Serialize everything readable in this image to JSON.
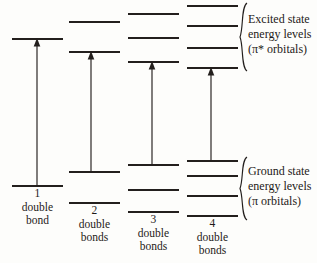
{
  "figure": {
    "background_color": "#fdfdfb",
    "ink_color": "#231f1d"
  },
  "columns": [
    {
      "id": "col-1",
      "number": "1",
      "word_line_1": "double",
      "word_line_2": "bond",
      "x_left": 12,
      "x_right": 63,
      "arrow_x": 37,
      "ground_levels": [
        186
      ],
      "excited_levels": [
        39
      ],
      "transition": {
        "from_y": 186,
        "to_y": 39
      }
    },
    {
      "id": "col-2",
      "number": "2",
      "word_line_1": "double",
      "word_line_2": "bonds",
      "x_left": 69,
      "x_right": 120,
      "arrow_x": 91,
      "ground_levels": [
        172,
        203
      ],
      "excited_levels": [
        22,
        52
      ],
      "transition": {
        "from_y": 172,
        "to_y": 52
      }
    },
    {
      "id": "col-3",
      "number": "3",
      "word_line_1": "double",
      "word_line_2": "bonds",
      "x_left": 128,
      "x_right": 179,
      "arrow_x": 152,
      "ground_levels": [
        165,
        190,
        212
      ],
      "excited_levels": [
        14,
        38,
        62
      ],
      "transition": {
        "from_y": 165,
        "to_y": 62
      }
    },
    {
      "id": "col-4",
      "number": "4",
      "word_line_1": "double",
      "word_line_2": "bonds",
      "x_left": 187,
      "x_right": 238,
      "arrow_x": 211,
      "ground_levels": [
        161,
        176,
        196,
        216
      ],
      "excited_levels": [
        6,
        26,
        48,
        68
      ],
      "transition": {
        "from_y": 161,
        "to_y": 68
      }
    }
  ],
  "annotations": {
    "excited": {
      "line_1": "Excited state",
      "line_2": "energy levels",
      "line_3": "(π* orbitals)",
      "brace_top_y": 3,
      "brace_bottom_y": 71,
      "text_x": 248,
      "text_y": 12
    },
    "ground": {
      "line_1": "Ground state",
      "line_2": "energy levels",
      "line_3": "(π orbitals)",
      "brace_top_y": 157,
      "brace_bottom_y": 220,
      "text_x": 248,
      "text_y": 164
    }
  },
  "chart_data": {
    "type": "line",
    "xlabel": "number of double bonds",
    "ylabel": "energy",
    "categories": [
      "1 double bond",
      "2 double bonds",
      "3 double bonds",
      "4 double bonds"
    ],
    "series": [
      {
        "name": "ground state (π) levels, screen y px (lower y = higher energy)",
        "values": [
          [
            186
          ],
          [
            172,
            203
          ],
          [
            165,
            190,
            212
          ],
          [
            161,
            176,
            196,
            216
          ]
        ]
      },
      {
        "name": "excited state (π*) levels, screen y px",
        "values": [
          [
            39
          ],
          [
            22,
            52
          ],
          [
            14,
            38,
            62
          ],
          [
            6,
            26,
            48,
            68
          ]
        ]
      },
      {
        "name": "HOMO-LUMO transition gap, px",
        "values": [
          147,
          120,
          103,
          93
        ]
      }
    ],
    "annotations": [
      "Excited state energy levels (π* orbitals)",
      "Ground state energy levels (π orbitals)"
    ],
    "grid": false,
    "legend": "none"
  }
}
